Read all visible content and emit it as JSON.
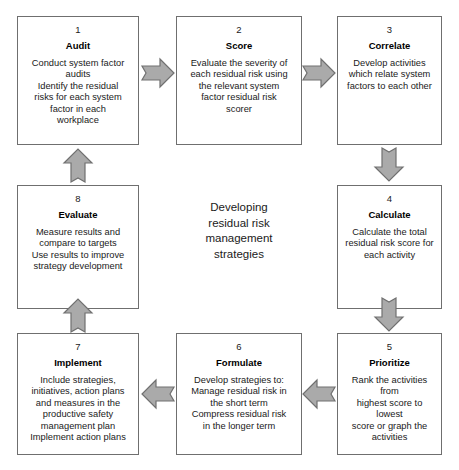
{
  "diagram": {
    "centre_caption": "Developing\nresidual risk\nmanagement\nstrategies",
    "arrow_fill": "#aaaaaa",
    "arrow_stroke": "#707070",
    "box_border": "#6f6f6f",
    "nodes": [
      {
        "number": "1",
        "title": "Audit",
        "body": "Conduct system factor\naudits\nIdentify the residual\nrisks for each system\nfactor in each\nworkplace"
      },
      {
        "number": "2",
        "title": "Score",
        "body": "Evaluate the severity of\neach residual risk using\nthe relevant system\nfactor residual risk\nscorer"
      },
      {
        "number": "3",
        "title": "Correlate",
        "body": "Develop activities\nwhich relate system\nfactors to each other"
      },
      {
        "number": "4",
        "title": "Calculate",
        "body": "Calculate the total\nresidual risk score for\neach activity"
      },
      {
        "number": "5",
        "title": "Prioritize",
        "body": "Rank the activities from\nhighest score to lowest\nscore or graph the\nactivities"
      },
      {
        "number": "6",
        "title": "Formulate",
        "body": "Develop strategies to:\nManage residual risk in\nthe short term\nCompress residual risk\nin the longer term"
      },
      {
        "number": "7",
        "title": "Implement",
        "body": "Include strategies,\ninitiatives, action plans\nand measures in the\nproductive safety\nmanagement plan\nImplement action plans"
      },
      {
        "number": "8",
        "title": "Evaluate",
        "body": "Measure results and\ncompare to targets\nUse results to improve\nstrategy development"
      }
    ],
    "arrows": [
      {
        "from": "1",
        "to": "2",
        "direction": "right"
      },
      {
        "from": "2",
        "to": "3",
        "direction": "right"
      },
      {
        "from": "3",
        "to": "4",
        "direction": "down"
      },
      {
        "from": "4",
        "to": "5",
        "direction": "down"
      },
      {
        "from": "5",
        "to": "6",
        "direction": "left"
      },
      {
        "from": "6",
        "to": "7",
        "direction": "left"
      },
      {
        "from": "7",
        "to": "8",
        "direction": "up"
      },
      {
        "from": "8",
        "to": "1",
        "direction": "up"
      }
    ]
  }
}
